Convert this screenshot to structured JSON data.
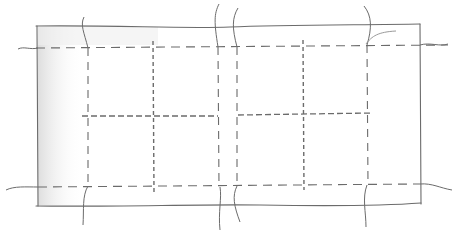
{
  "diagram": {
    "type": "hand-drawn pencil sketch",
    "colors": {
      "background": "#ffffff",
      "pencil": "#6b6b6b",
      "shade": "#e4e4e4"
    },
    "outer_rect": {
      "x1": 37,
      "y1": 26,
      "x2": 420,
      "y2": 206
    },
    "dashed_horizontal": [
      {
        "y": 47,
        "x1": 22,
        "x2": 450
      },
      {
        "y": 186,
        "x1": 10,
        "x2": 452
      }
    ],
    "dashed_middle": [
      {
        "y": 116,
        "x1": 80,
        "x2": 218
      },
      {
        "y": 115,
        "x1": 237,
        "x2": 372
      }
    ],
    "dashed_vertical": [
      {
        "x": 88,
        "y1": 47,
        "y2": 186
      },
      {
        "x": 153,
        "y1": 42,
        "y2": 192,
        "style": "dense"
      },
      {
        "x": 218,
        "y1": 47,
        "y2": 186
      },
      {
        "x": 237,
        "y1": 47,
        "y2": 186
      },
      {
        "x": 303,
        "y1": 42,
        "y2": 190,
        "style": "dense"
      },
      {
        "x": 367,
        "y1": 47,
        "y2": 186
      }
    ],
    "panels": {
      "columns": 4,
      "rows": 2
    }
  }
}
